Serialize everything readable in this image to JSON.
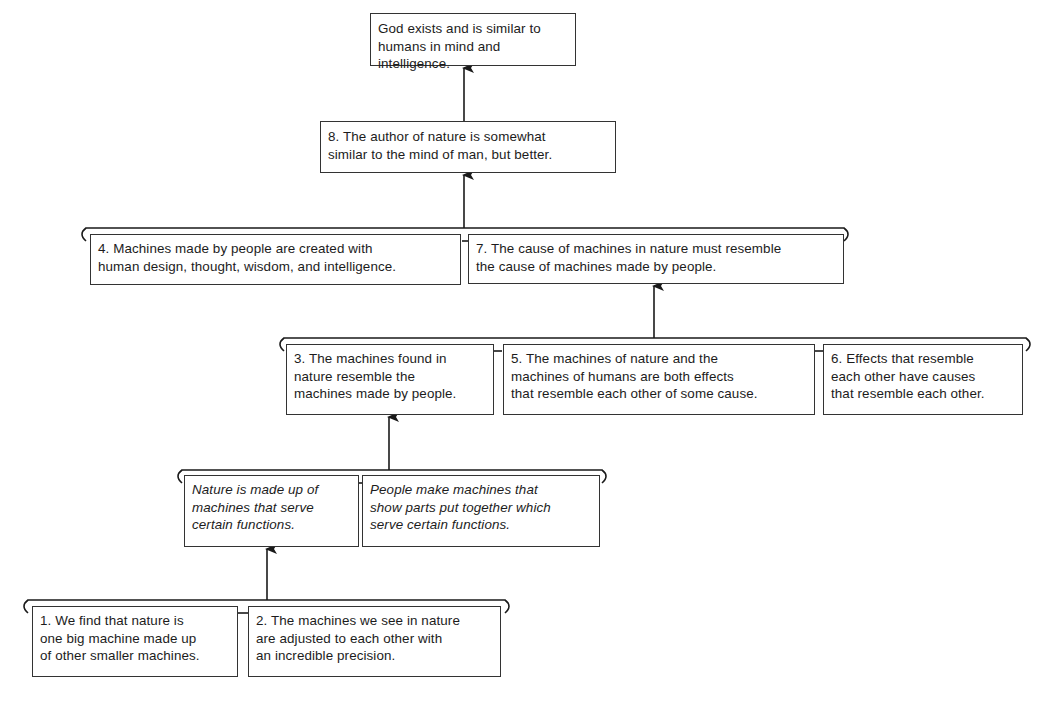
{
  "diagram": {
    "type": "argument-map",
    "conclusion": {
      "text": "God exists and is similar to\nhumans in mind and intelligence."
    },
    "level1": {
      "p8": "8. The author of nature is somewhat\nsimilar to the mind of man, but better."
    },
    "level2": {
      "p4": "4. Machines made by people are created with\nhuman design, thought, wisdom, and intelligence.",
      "p7": "7. The cause of machines in nature must resemble\nthe cause of machines made by people."
    },
    "level3": {
      "p3": "3. The machines found in\nnature resemble the\nmachines made by people.",
      "p5": "5. The machines of nature and the\nmachines of humans are both effects\nthat resemble each other of some cause.",
      "p6": "6. Effects that resemble\neach other have causes\nthat resemble each other."
    },
    "level4": {
      "sub_a": "Nature is made up of\nmachines that serve\ncertain functions.",
      "sub_b": "People make machines that\nshow parts put together which\nserve certain functions."
    },
    "level5": {
      "p1": "1. We find that nature is\none big machine made up\nof other smaller machines.",
      "p2": "2. The machines we see in nature\nare adjusted to each other with\nan incredible precision."
    },
    "colors": {
      "line": "#1a1a1a",
      "box_border": "#333333",
      "background": "#ffffff"
    }
  }
}
